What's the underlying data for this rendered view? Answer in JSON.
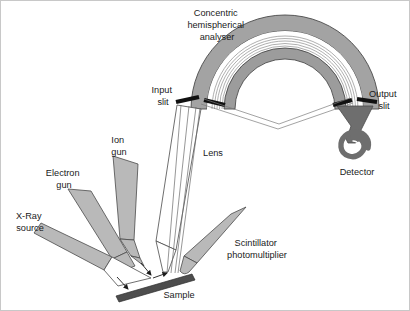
{
  "figure": {
    "kind": "schematic-diagram",
    "background_color": "#ffffff",
    "border_color": "#c8c8c8"
  },
  "palette": {
    "component_gray": "#a3a3a3",
    "component_gray_dark": "#8f8f8f",
    "gun_gray": "#b9b9b9",
    "detector_gray": "#6e6e6e",
    "sample_gray": "#4d4d4d",
    "slit_black": "#111111",
    "outline": "#3a3a3a",
    "text": "#1a1a1a"
  },
  "labels": {
    "analyser": {
      "name": "concentric-hemispherical-analyser-label",
      "lines": [
        "Concentric",
        "hemispherical",
        "analyser"
      ],
      "x": 216,
      "y": 13
    },
    "input_slit": {
      "name": "input-slit-label",
      "lines": [
        "Input",
        "slit"
      ],
      "x": 162,
      "y": 90
    },
    "output_slit": {
      "name": "output-slit-label",
      "lines": [
        "Output",
        "slit"
      ],
      "x": 381,
      "y": 94
    },
    "lens": {
      "name": "lens-label",
      "lines": [
        "Lens"
      ],
      "x": 212,
      "y": 153
    },
    "detector": {
      "name": "detector-label",
      "lines": [
        "Detector"
      ],
      "x": 356,
      "y": 172
    },
    "ion_gun": {
      "name": "ion-gun-label",
      "lines": [
        "Ion",
        "gun"
      ],
      "x": 118,
      "y": 140
    },
    "electron_gun": {
      "name": "electron-gun-label",
      "lines": [
        "Electron",
        "gun"
      ],
      "x": 63,
      "y": 173
    },
    "xray_source": {
      "name": "x-ray-source-label",
      "lines": [
        "X-Ray",
        "source"
      ],
      "x": 29,
      "y": 216
    },
    "scintillator": {
      "name": "scintillator-photomultiplier-label",
      "lines": [
        "Scintillator",
        "photomultiplier"
      ],
      "x": 256,
      "y": 243
    },
    "sample": {
      "name": "sample-label",
      "lines": [
        "Sample"
      ],
      "x": 178,
      "y": 295
    }
  },
  "components": [
    {
      "name": "hemispherical-analyser-outer-shell",
      "type": "arc"
    },
    {
      "name": "hemispherical-analyser-inner-shell",
      "type": "arc"
    },
    {
      "name": "electron-trajectory-bundle",
      "type": "arc-lines"
    },
    {
      "name": "input-slit-aperture",
      "type": "slit"
    },
    {
      "name": "output-slit-aperture",
      "type": "slit"
    },
    {
      "name": "electrostatic-lens-column",
      "type": "outline"
    },
    {
      "name": "channeltron-detector",
      "type": "filled"
    },
    {
      "name": "ion-gun-body",
      "type": "filled"
    },
    {
      "name": "electron-gun-body",
      "type": "filled"
    },
    {
      "name": "x-ray-source-body",
      "type": "filled"
    },
    {
      "name": "scintillator-photomultiplier-body",
      "type": "filled"
    },
    {
      "name": "sample-stage-bar",
      "type": "filled"
    }
  ]
}
